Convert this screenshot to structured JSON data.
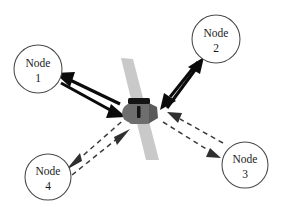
{
  "diagram": {
    "background_color": "#ffffff",
    "canvas": {
      "width": 288,
      "height": 207
    }
  },
  "nodes": [
    {
      "id": "node-1",
      "label_top": "Node",
      "label_bottom": "1",
      "cx": 38,
      "cy": 69,
      "r": 24,
      "link_style": "solid",
      "link_direction": "bidirectional"
    },
    {
      "id": "node-2",
      "label_top": "Node",
      "label_bottom": "2",
      "cx": 216,
      "cy": 39,
      "r": 24,
      "link_style": "solid",
      "link_direction": "bidirectional"
    },
    {
      "id": "node-3",
      "label_top": "Node",
      "label_bottom": "3",
      "cx": 245,
      "cy": 165,
      "r": 23,
      "link_style": "dashed",
      "link_direction": "bidirectional"
    },
    {
      "id": "node-4",
      "label_top": "Node",
      "label_bottom": "4",
      "cx": 48,
      "cy": 177,
      "r": 23,
      "link_style": "dashed",
      "link_direction": "bidirectional"
    }
  ],
  "satellite": {
    "id": "satellite-center",
    "name": "satellite",
    "body_cx": 139,
    "body_cy": 111,
    "panel_color": "#c9c9c9",
    "body_color": "#6e6e6e",
    "band_color": "#141414"
  },
  "links": [
    {
      "id": "link-node-1",
      "from": "node-1",
      "to": "satellite-center",
      "style": "solid",
      "color": "#0b0b0b",
      "arrows": "both"
    },
    {
      "id": "link-node-2",
      "from": "node-2",
      "to": "satellite-center",
      "style": "solid",
      "color": "#0b0b0b",
      "arrows": "both"
    },
    {
      "id": "link-node-3",
      "from": "node-3",
      "to": "satellite-center",
      "style": "dashed",
      "color": "#3d3d3d",
      "arrows": "both"
    },
    {
      "id": "link-node-4",
      "from": "node-4",
      "to": "satellite-center",
      "style": "dashed",
      "color": "#3d3d3d",
      "arrows": "both"
    }
  ]
}
